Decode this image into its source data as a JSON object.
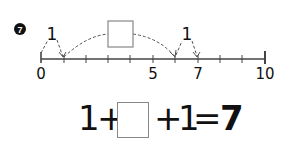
{
  "problem": {
    "number_badge": "7",
    "numberline": {
      "min": 0,
      "max": 10,
      "labels": [
        "0",
        "5",
        "7",
        "10"
      ],
      "hop_labels": [
        "1",
        "1"
      ],
      "jumps": [
        {
          "from": 0,
          "to": 1,
          "label": "1"
        },
        {
          "from": 1,
          "to": 6,
          "label": "answer-box"
        },
        {
          "from": 6,
          "to": 7,
          "label": "1"
        }
      ]
    },
    "equation": {
      "term1": "1",
      "plus1": "+",
      "blank": "",
      "plus2": "+",
      "term3": "1",
      "equals": "=",
      "result": "7"
    }
  }
}
